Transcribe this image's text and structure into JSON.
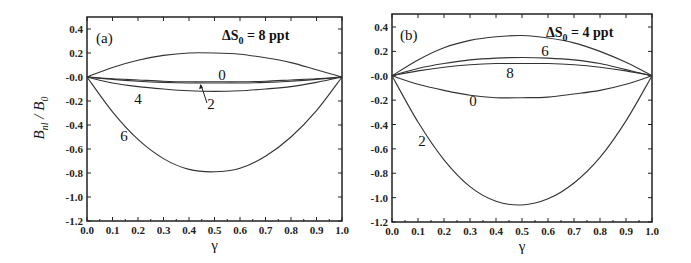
{
  "figure": {
    "ylabel_main": "B",
    "ylabel_sub1": "nl",
    "ylabel_slash": " / ",
    "ylabel_main2": "B",
    "ylabel_sub2": "0",
    "xlabel": "γ"
  },
  "panels": [
    {
      "label": "(a)",
      "annotation_prefix": "ΔS",
      "annotation_sub": "0",
      "annotation_suffix": " = 8 ppt",
      "curve_labels": [
        "0",
        "4",
        "2",
        "6"
      ]
    },
    {
      "label": "(b)",
      "annotation_prefix": "ΔS",
      "annotation_sub": "0",
      "annotation_suffix": " = 4 ppt",
      "curve_labels": [
        "6",
        "8",
        "0",
        "2"
      ]
    }
  ],
  "x_ticks": [
    "0.0",
    "0.1",
    "0.2",
    "0.3",
    "0.4",
    "0.5",
    "0.6",
    "0.7",
    "0.8",
    "0.9",
    "1.0"
  ],
  "y_ticks": [
    "0.4",
    "0.2",
    "-0.0",
    "-0.2",
    "-0.4",
    "-0.6",
    "-0.8",
    "-1.0",
    "-1.2"
  ],
  "chart_data": [
    {
      "type": "line",
      "title": "(a) ΔS0 = 8 ppt",
      "xlabel": "γ",
      "ylabel": "B_nl / B_0",
      "xlim": [
        0.0,
        1.0
      ],
      "ylim": [
        -1.2,
        0.45
      ],
      "grid": false,
      "x": [
        0.0,
        0.1,
        0.2,
        0.3,
        0.4,
        0.5,
        0.6,
        0.7,
        0.8,
        0.9,
        1.0
      ],
      "series": [
        {
          "name": "top (unlabeled, ΔS0 = 8 ppt)",
          "values": [
            0.0,
            0.08,
            0.14,
            0.18,
            0.2,
            0.2,
            0.19,
            0.16,
            0.12,
            0.06,
            0.0
          ]
        },
        {
          "name": "0",
          "values": [
            0.0,
            -0.015,
            -0.025,
            -0.035,
            -0.04,
            -0.04,
            -0.04,
            -0.035,
            -0.025,
            -0.015,
            0.0
          ]
        },
        {
          "name": "2",
          "values": [
            0.0,
            -0.02,
            -0.035,
            -0.045,
            -0.05,
            -0.05,
            -0.05,
            -0.045,
            -0.035,
            -0.02,
            0.0
          ]
        },
        {
          "name": "4",
          "values": [
            0.0,
            -0.05,
            -0.08,
            -0.1,
            -0.115,
            -0.12,
            -0.115,
            -0.1,
            -0.08,
            -0.045,
            0.0
          ]
        },
        {
          "name": "6",
          "values": [
            0.0,
            -0.29,
            -0.52,
            -0.68,
            -0.77,
            -0.79,
            -0.76,
            -0.66,
            -0.5,
            -0.28,
            0.0
          ]
        }
      ]
    },
    {
      "type": "line",
      "title": "(b) ΔS0 = 4 ppt",
      "xlabel": "γ",
      "ylabel": "B_nl / B_0",
      "xlim": [
        0.0,
        1.0
      ],
      "ylim": [
        -1.2,
        0.45
      ],
      "grid": false,
      "x": [
        0.0,
        0.1,
        0.2,
        0.3,
        0.4,
        0.5,
        0.6,
        0.7,
        0.8,
        0.9,
        1.0
      ],
      "series": [
        {
          "name": "top (unlabeled, ΔS0 = 4 ppt)",
          "values": [
            0.0,
            0.13,
            0.23,
            0.29,
            0.32,
            0.33,
            0.31,
            0.27,
            0.2,
            0.11,
            0.0
          ]
        },
        {
          "name": "6",
          "values": [
            0.0,
            0.06,
            0.1,
            0.13,
            0.145,
            0.15,
            0.145,
            0.13,
            0.1,
            0.05,
            0.0
          ]
        },
        {
          "name": "8",
          "values": [
            0.0,
            0.04,
            0.07,
            0.09,
            0.1,
            0.1,
            0.1,
            0.09,
            0.07,
            0.04,
            0.0
          ]
        },
        {
          "name": "0",
          "values": [
            0.0,
            -0.07,
            -0.12,
            -0.16,
            -0.18,
            -0.18,
            -0.175,
            -0.15,
            -0.12,
            -0.07,
            0.0
          ]
        },
        {
          "name": "2",
          "values": [
            0.0,
            -0.38,
            -0.69,
            -0.91,
            -1.03,
            -1.06,
            -1.01,
            -0.88,
            -0.67,
            -0.37,
            0.0
          ]
        }
      ]
    }
  ]
}
